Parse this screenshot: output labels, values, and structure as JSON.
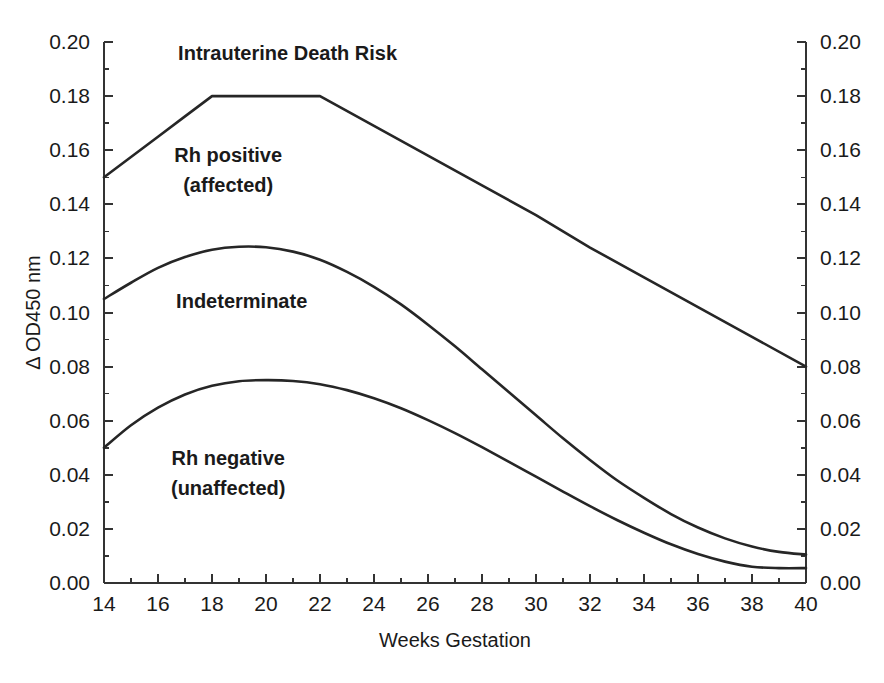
{
  "chart_data": {
    "type": "line",
    "title": "",
    "xlabel": "Weeks Gestation",
    "ylabel": "Δ OD450 nm",
    "ylabel_right": "Δ OD450 nm",
    "xlim": [
      14,
      40
    ],
    "ylim": [
      0.0,
      0.2
    ],
    "grid": false,
    "legend": "none",
    "x_ticks": [
      14,
      16,
      18,
      20,
      22,
      24,
      26,
      28,
      30,
      32,
      34,
      36,
      38,
      40
    ],
    "x_tick_labels": [
      "14",
      "16",
      "18",
      "20",
      "22",
      "24",
      "26",
      "28",
      "30",
      "32",
      "34",
      "36",
      "38",
      "40"
    ],
    "x_minor_ticks": [
      15,
      17,
      19,
      21,
      23,
      25,
      27,
      29,
      31,
      33,
      35,
      37,
      39
    ],
    "y_ticks": [
      0.0,
      0.02,
      0.04,
      0.06,
      0.08,
      0.1,
      0.12,
      0.14,
      0.16,
      0.18,
      0.2
    ],
    "y_tick_labels": [
      "0.00",
      "0.02",
      "0.04",
      "0.06",
      "0.08",
      "0.10",
      "0.12",
      "0.14",
      "0.16",
      "0.18",
      "0.20"
    ],
    "y_minor_ticks": [
      0.01,
      0.03,
      0.05,
      0.07,
      0.09,
      0.11,
      0.13,
      0.15,
      0.17,
      0.19
    ],
    "y_ticks_right": [
      0.0,
      0.02,
      0.04,
      0.06,
      0.08,
      0.1,
      0.12,
      0.14,
      0.16,
      0.18,
      0.2
    ],
    "y_tick_labels_right": [
      "0.00",
      "0.02",
      "0.04",
      "0.06",
      "0.08",
      "0.10",
      "0.12",
      "0.14",
      "0.16",
      "0.18",
      "0.20"
    ],
    "line_color": "#262626",
    "series": [
      {
        "name": "upper-zone-boundary",
        "x": [
          14,
          15,
          16,
          17,
          18,
          19,
          20,
          21,
          22,
          24,
          26,
          28,
          30,
          32,
          34,
          36,
          38,
          40
        ],
        "values": [
          0.15,
          0.1575,
          0.165,
          0.1725,
          0.18,
          0.18,
          0.18,
          0.18,
          0.18,
          0.169,
          0.158,
          0.147,
          0.136,
          0.124,
          0.113,
          0.102,
          0.091,
          0.08
        ]
      },
      {
        "name": "middle-zone-boundary",
        "x": [
          14,
          15,
          16,
          17,
          18,
          19,
          20,
          21,
          22,
          23,
          24,
          25,
          26,
          27,
          28,
          29,
          30,
          31,
          32,
          33,
          34,
          35,
          36,
          37,
          38,
          39,
          40
        ],
        "values": [
          0.105,
          0.111,
          0.1165,
          0.1205,
          0.1232,
          0.1243,
          0.1241,
          0.1225,
          0.1195,
          0.115,
          0.1095,
          0.103,
          0.0955,
          0.0875,
          0.079,
          0.0705,
          0.062,
          0.0535,
          0.0455,
          0.038,
          0.0315,
          0.0255,
          0.0205,
          0.0165,
          0.0135,
          0.0115,
          0.0105
        ]
      },
      {
        "name": "lower-zone-boundary",
        "x": [
          14,
          15,
          16,
          17,
          18,
          19,
          20,
          21,
          22,
          23,
          24,
          25,
          26,
          27,
          28,
          29,
          30,
          31,
          32,
          33,
          34,
          35,
          36,
          37,
          38,
          39,
          40
        ],
        "values": [
          0.05,
          0.0583,
          0.0648,
          0.0697,
          0.0729,
          0.0746,
          0.075,
          0.0747,
          0.0735,
          0.0713,
          0.0683,
          0.0646,
          0.0602,
          0.0554,
          0.0502,
          0.0448,
          0.0393,
          0.0338,
          0.0284,
          0.0233,
          0.0186,
          0.0143,
          0.0107,
          0.0079,
          0.006,
          0.0055,
          0.0055
        ]
      }
    ],
    "annotations": [
      {
        "text": "Intrauterine Death Risk",
        "x": 20.8,
        "y": 0.1935
      },
      {
        "text": "Rh positive",
        "x": 18.6,
        "y": 0.1555
      },
      {
        "text": "(affected)",
        "x": 18.6,
        "y": 0.1445
      },
      {
        "text": "Indeterminate",
        "x": 19.1,
        "y": 0.1015
      },
      {
        "text": "Rh negative",
        "x": 18.6,
        "y": 0.0435
      },
      {
        "text": "(unaffected)",
        "x": 18.6,
        "y": 0.0325
      }
    ]
  }
}
